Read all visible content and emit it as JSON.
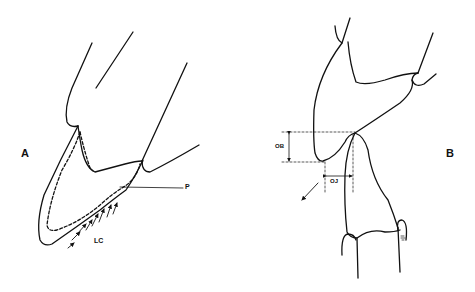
{
  "figure": {
    "panels": [
      {
        "id": "A",
        "label": "A",
        "annotations": {
          "p": "P",
          "lc": "LC"
        }
      },
      {
        "id": "B",
        "label": "B",
        "annotations": {
          "ob": "OB",
          "oj": "OJ"
        }
      }
    ],
    "colors": {
      "line": "#111111",
      "background": "#ffffff"
    }
  }
}
